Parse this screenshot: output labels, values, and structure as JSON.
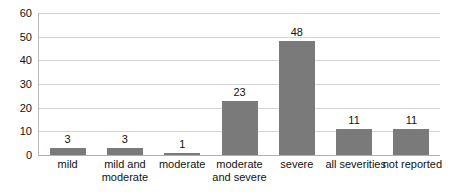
{
  "chart_data": {
    "type": "bar",
    "title": "",
    "subtitle": "",
    "xlabel": "",
    "ylabel": "",
    "categories": [
      "mild",
      "mild and moderate",
      "moderate",
      "moderate and severe",
      "severe",
      "all severities",
      "not reported"
    ],
    "category_lines": [
      [
        "mild"
      ],
      [
        "mild and",
        "moderate"
      ],
      [
        "moderate"
      ],
      [
        "moderate",
        "and severe"
      ],
      [
        "severe"
      ],
      [
        "all severities"
      ],
      [
        "not reported"
      ]
    ],
    "values": [
      3,
      3,
      1,
      23,
      48,
      11,
      11
    ],
    "data_labels": [
      "3",
      "3",
      "1",
      "23",
      "48",
      "11",
      "11"
    ],
    "ylim": [
      0,
      60
    ],
    "yticks": [
      0,
      10,
      20,
      30,
      40,
      50,
      60
    ],
    "ytick_labels": [
      "0",
      "10",
      "20",
      "30",
      "40",
      "50",
      "60"
    ],
    "grid": true,
    "legend": false,
    "legend_position": "none",
    "bar_color": "#7a7a7a",
    "gridline_color": "#d4d4d4",
    "axis_color": "#b8b8b8",
    "text_color": "#111111",
    "background_color": "#ffffff"
  }
}
